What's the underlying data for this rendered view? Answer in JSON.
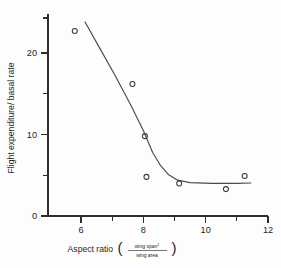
{
  "chart_data": {
    "type": "scatter",
    "title": "",
    "xlabel": "Aspect ratio",
    "xlabel_fraction_numerator": "wing span",
    "xlabel_fraction_numerator_sup": "2",
    "xlabel_fraction_denominator": "wing area",
    "ylabel": "Flight expenditure/ basal rate",
    "xlim": [
      5.0,
      12.0
    ],
    "ylim": [
      0,
      26
    ],
    "x_ticks_major": [
      6,
      8,
      10,
      12
    ],
    "x_ticks_major_labels": [
      "6",
      "8",
      "10",
      "12"
    ],
    "x_ticks_minor": [
      7,
      9,
      11
    ],
    "y_ticks_major": [
      0,
      10,
      20
    ],
    "y_ticks_major_labels": [
      "0",
      "10",
      "20"
    ],
    "y_ticks_minor": [
      5,
      15,
      25
    ],
    "grid": false,
    "legend": null,
    "marker": "open-circle",
    "points": [
      {
        "x": 5.8,
        "y": 22.7
      },
      {
        "x": 7.65,
        "y": 16.2
      },
      {
        "x": 8.05,
        "y": 9.8
      },
      {
        "x": 8.1,
        "y": 4.8
      },
      {
        "x": 9.15,
        "y": 4.0
      },
      {
        "x": 10.65,
        "y": 3.3
      },
      {
        "x": 11.25,
        "y": 4.9
      }
    ],
    "fit_curve": {
      "description": "declining curve flattening to asymptote near 4",
      "points": [
        {
          "x": 6.13,
          "y": 23.8
        },
        {
          "x": 6.6,
          "y": 20.6
        },
        {
          "x": 7.1,
          "y": 17.2
        },
        {
          "x": 7.6,
          "y": 13.6
        },
        {
          "x": 8.0,
          "y": 10.5
        },
        {
          "x": 8.3,
          "y": 7.8
        },
        {
          "x": 8.55,
          "y": 6.2
        },
        {
          "x": 8.8,
          "y": 5.1
        },
        {
          "x": 9.1,
          "y": 4.4
        },
        {
          "x": 9.5,
          "y": 4.1
        },
        {
          "x": 10.2,
          "y": 4.0
        },
        {
          "x": 11.0,
          "y": 4.0
        },
        {
          "x": 11.45,
          "y": 4.05
        }
      ]
    }
  },
  "figure": {
    "background_color": "#fdfdfd",
    "axis_color": "#2e2e2e",
    "marker_color": "#3a3a3a",
    "curve_color": "#4a4a4a"
  }
}
